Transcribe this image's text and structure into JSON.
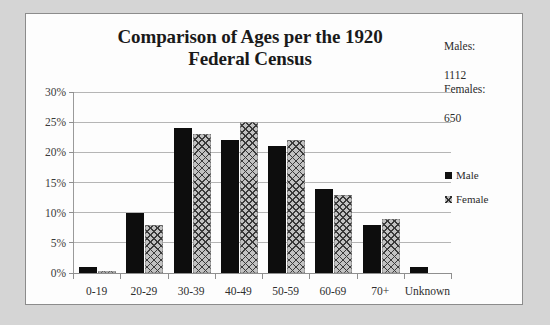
{
  "chart_data": {
    "type": "bar",
    "title": "Comparison of Ages per the 1920 Federal Census",
    "title_line1": "Comparison of Ages per the 1920",
    "title_line2": "Federal Census",
    "xlabel": "",
    "ylabel": "",
    "categories": [
      "0-19",
      "20-29",
      "30-39",
      "40-49",
      "50-59",
      "60-69",
      "70+",
      "Unknown"
    ],
    "series": [
      {
        "name": "Male",
        "values": [
          1,
          10,
          24,
          22,
          21,
          14,
          8,
          1
        ]
      },
      {
        "name": "Female",
        "values": [
          0.3,
          8,
          23,
          25,
          22,
          13,
          9,
          0
        ]
      }
    ],
    "ylim": [
      0,
      30
    ],
    "yticks": [
      0,
      5,
      10,
      15,
      20,
      25,
      30
    ],
    "ytick_labels": [
      "0%",
      "5%",
      "10%",
      "15%",
      "20%",
      "25%",
      "30%"
    ],
    "value_suffix": "%",
    "grid": true,
    "legend_position": "right",
    "legend": [
      "Male",
      "Female"
    ],
    "annotations": [
      {
        "label": "Males:",
        "value": "1112"
      },
      {
        "label": "Females:",
        "value": "650"
      }
    ]
  },
  "notes": {
    "males_label": "Males:",
    "males_value": "1112",
    "females_label": "Females:",
    "females_value": "650"
  },
  "colors": {
    "male_bar": "#0d0d0d",
    "female_bar": "#c2c2c2",
    "gridline": "#b5b5b5",
    "panel_background": "#fdfdfd",
    "page_background": "#d5d5d5",
    "panel_border": "#8c8c8c"
  }
}
